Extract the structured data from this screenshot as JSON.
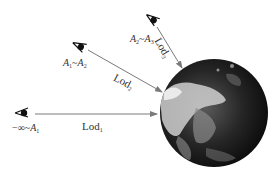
{
  "diagram": {
    "type": "level-of-detail viewpoint diagram",
    "colors": {
      "arrow": "#7a7a7a",
      "text": "#333333",
      "eye": "#111111",
      "earth_dark": "#0e0e0e",
      "earth_light": "#d8d8d8",
      "background": "#ffffff"
    },
    "viewpoints": [
      {
        "id": "viewpoint-1",
        "range_label": {
          "prefix": "−∞~",
          "var": "A",
          "sub": "1"
        },
        "lod_label": {
          "text": "Lod",
          "sub": "1"
        }
      },
      {
        "id": "viewpoint-2",
        "range_label": {
          "var1": "A",
          "sub1": "1",
          "sep": "~",
          "var2": "A",
          "sub2": "2"
        },
        "lod_label": {
          "text": "Lod",
          "sub": "2"
        }
      },
      {
        "id": "viewpoint-3",
        "range_label": {
          "var1": "A",
          "sub1": "2",
          "sep": "~",
          "var2": "A",
          "sub2": "3"
        },
        "lod_label": {
          "text": "Lod",
          "sub": "3"
        }
      }
    ],
    "target": {
      "name": "Earth globe"
    }
  }
}
